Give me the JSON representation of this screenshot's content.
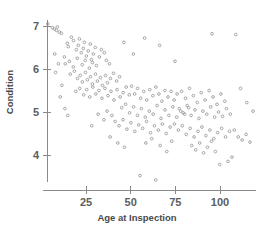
{
  "chart_data": {
    "type": "scatter",
    "title": "",
    "xlabel": "Age at Inspection",
    "ylabel": "Condition",
    "xlim": [
      0,
      120
    ],
    "ylim": [
      3.2,
      7.4
    ],
    "xticks": [
      25,
      50,
      75,
      100
    ],
    "xticklabels": [
      "25",
      "50",
      "75",
      "100"
    ],
    "yticks": [
      4,
      5,
      6,
      7
    ],
    "yticklabels": [
      "4",
      "5",
      "6",
      "7"
    ],
    "grid": false,
    "legend": null,
    "marker": "open-circle",
    "marker_color": "#9d9d9d",
    "axis_color": "#8a8a8a",
    "n_points": 201,
    "points": [
      [
        3.6,
        7.05
      ],
      [
        6.2,
        6.96
      ],
      [
        7.3,
        6.93
      ],
      [
        8.4,
        6.9
      ],
      [
        9.0,
        6.98
      ],
      [
        10.1,
        6.86
      ],
      [
        11.2,
        6.83
      ],
      [
        14.5,
        6.6
      ],
      [
        15.1,
        6.52
      ],
      [
        16.8,
        6.74
      ],
      [
        18.0,
        6.66
      ],
      [
        19.6,
        6.45
      ],
      [
        20.7,
        6.55
      ],
      [
        21.3,
        6.7
      ],
      [
        22.4,
        6.38
      ],
      [
        23.5,
        6.48
      ],
      [
        24.1,
        6.62
      ],
      [
        25.2,
        6.3
      ],
      [
        26.3,
        6.42
      ],
      [
        27.4,
        6.58
      ],
      [
        28.0,
        6.22
      ],
      [
        29.1,
        6.35
      ],
      [
        30.2,
        6.5
      ],
      [
        12.9,
        6.28
      ],
      [
        13.4,
        6.12
      ],
      [
        15.7,
        6.18
      ],
      [
        17.9,
        6.05
      ],
      [
        20.1,
        6.25
      ],
      [
        22.9,
        6.1
      ],
      [
        24.6,
        6.2
      ],
      [
        26.9,
        6.02
      ],
      [
        28.6,
        6.15
      ],
      [
        30.8,
        6.08
      ],
      [
        32.5,
        6.28
      ],
      [
        33.6,
        6.45
      ],
      [
        35.3,
        6.38
      ],
      [
        36.4,
        6.2
      ],
      [
        38.1,
        6.12
      ],
      [
        16.2,
        5.88
      ],
      [
        18.5,
        5.95
      ],
      [
        20.2,
        5.78
      ],
      [
        21.8,
        5.85
      ],
      [
        23.0,
        5.7
      ],
      [
        24.7,
        5.92
      ],
      [
        25.8,
        5.75
      ],
      [
        27.5,
        5.82
      ],
      [
        28.6,
        5.65
      ],
      [
        30.3,
        5.88
      ],
      [
        31.4,
        5.72
      ],
      [
        33.1,
        5.8
      ],
      [
        34.2,
        5.62
      ],
      [
        35.9,
        5.85
      ],
      [
        37.0,
        5.68
      ],
      [
        38.7,
        5.78
      ],
      [
        40.4,
        5.9
      ],
      [
        42.1,
        5.72
      ],
      [
        43.8,
        5.82
      ],
      [
        19.3,
        5.48
      ],
      [
        21.5,
        5.55
      ],
      [
        23.7,
        5.4
      ],
      [
        25.4,
        5.52
      ],
      [
        27.1,
        5.35
      ],
      [
        28.8,
        5.58
      ],
      [
        30.5,
        5.42
      ],
      [
        32.2,
        5.5
      ],
      [
        33.9,
        5.32
      ],
      [
        35.6,
        5.55
      ],
      [
        37.3,
        5.38
      ],
      [
        39.0,
        5.48
      ],
      [
        40.7,
        5.28
      ],
      [
        42.4,
        5.52
      ],
      [
        44.1,
        5.35
      ],
      [
        45.8,
        5.45
      ],
      [
        47.5,
        5.58
      ],
      [
        49.2,
        5.4
      ],
      [
        8.0,
        5.92
      ],
      [
        10.6,
        5.35
      ],
      [
        13.2,
        5.08
      ],
      [
        11.5,
        5.62
      ],
      [
        14.8,
        4.92
      ],
      [
        7.5,
        6.35
      ],
      [
        9.6,
        6.12
      ],
      [
        50.5,
        5.6
      ],
      [
        52.2,
        5.42
      ],
      [
        53.9,
        5.55
      ],
      [
        55.6,
        5.32
      ],
      [
        57.3,
        5.48
      ],
      [
        59.0,
        5.28
      ],
      [
        60.7,
        5.52
      ],
      [
        62.4,
        5.38
      ],
      [
        64.1,
        5.58
      ],
      [
        65.8,
        5.42
      ],
      [
        67.5,
        5.25
      ],
      [
        69.2,
        5.5
      ],
      [
        70.9,
        5.35
      ],
      [
        72.6,
        5.48
      ],
      [
        74.3,
        5.28
      ],
      [
        76.0,
        5.42
      ],
      [
        45.0,
        5.1
      ],
      [
        47.2,
        5.18
      ],
      [
        49.4,
        4.98
      ],
      [
        51.6,
        5.12
      ],
      [
        53.8,
        4.92
      ],
      [
        56.0,
        5.08
      ],
      [
        58.2,
        4.88
      ],
      [
        60.4,
        5.02
      ],
      [
        62.6,
        4.95
      ],
      [
        64.8,
        5.15
      ],
      [
        67.0,
        4.85
      ],
      [
        69.2,
        5.05
      ],
      [
        71.4,
        4.92
      ],
      [
        73.6,
        5.12
      ],
      [
        75.8,
        4.88
      ],
      [
        78.0,
        5.02
      ],
      [
        80.2,
        4.95
      ],
      [
        82.4,
        5.1
      ],
      [
        41.3,
        4.78
      ],
      [
        43.5,
        4.68
      ],
      [
        45.7,
        4.82
      ],
      [
        47.9,
        4.6
      ],
      [
        50.1,
        4.75
      ],
      [
        52.3,
        4.55
      ],
      [
        54.5,
        4.7
      ],
      [
        56.7,
        4.62
      ],
      [
        58.9,
        4.78
      ],
      [
        61.1,
        4.52
      ],
      [
        63.3,
        4.68
      ],
      [
        65.5,
        4.58
      ],
      [
        67.7,
        4.72
      ],
      [
        69.9,
        4.5
      ],
      [
        72.1,
        4.65
      ],
      [
        78.5,
        5.48
      ],
      [
        80.7,
        5.32
      ],
      [
        82.9,
        5.55
      ],
      [
        85.1,
        5.38
      ],
      [
        87.3,
        5.22
      ],
      [
        89.5,
        5.45
      ],
      [
        91.7,
        5.28
      ],
      [
        93.9,
        5.5
      ],
      [
        96.1,
        5.35
      ],
      [
        98.3,
        5.18
      ],
      [
        100.5,
        5.42
      ],
      [
        102.7,
        5.25
      ],
      [
        77.2,
        5.08
      ],
      [
        79.4,
        4.98
      ],
      [
        81.6,
        5.15
      ],
      [
        83.8,
        4.92
      ],
      [
        86.0,
        5.05
      ],
      [
        88.2,
        4.85
      ],
      [
        90.4,
        5.02
      ],
      [
        92.6,
        4.95
      ],
      [
        94.8,
        5.12
      ],
      [
        97.0,
        4.88
      ],
      [
        99.2,
        5.0
      ],
      [
        101.4,
        4.9
      ],
      [
        103.6,
        5.08
      ],
      [
        105.8,
        4.95
      ],
      [
        74.5,
        4.72
      ],
      [
        76.7,
        4.58
      ],
      [
        78.9,
        4.68
      ],
      [
        81.1,
        4.48
      ],
      [
        83.3,
        4.62
      ],
      [
        85.5,
        4.42
      ],
      [
        87.7,
        4.55
      ],
      [
        89.9,
        4.65
      ],
      [
        92.1,
        4.45
      ],
      [
        94.3,
        4.58
      ],
      [
        96.5,
        4.38
      ],
      [
        98.7,
        4.52
      ],
      [
        100.9,
        4.62
      ],
      [
        103.1,
        4.42
      ],
      [
        105.3,
        4.55
      ],
      [
        84.2,
        4.22
      ],
      [
        86.4,
        4.12
      ],
      [
        88.6,
        4.28
      ],
      [
        90.8,
        4.05
      ],
      [
        93.0,
        4.18
      ],
      [
        95.2,
        4.32
      ],
      [
        97.4,
        4.08
      ],
      [
        108.0,
        4.58
      ],
      [
        110.2,
        4.42
      ],
      [
        112.4,
        4.35
      ],
      [
        114.6,
        4.48
      ],
      [
        116.8,
        4.3
      ],
      [
        104.5,
        3.85
      ],
      [
        106.7,
        3.95
      ],
      [
        99.8,
        3.78
      ],
      [
        55.2,
        3.52
      ],
      [
        64.0,
        3.42
      ],
      [
        42.8,
        4.28
      ],
      [
        46.5,
        4.18
      ],
      [
        38.5,
        4.42
      ],
      [
        66.5,
        4.22
      ],
      [
        70.2,
        4.08
      ],
      [
        73.0,
        4.32
      ],
      [
        118.5,
        5.02
      ],
      [
        115.0,
        5.22
      ],
      [
        111.5,
        5.55
      ],
      [
        108.8,
        6.8
      ],
      [
        95.5,
        6.82
      ],
      [
        57.8,
        6.72
      ],
      [
        66.2,
        6.55
      ],
      [
        74.8,
        6.18
      ],
      [
        46.2,
        6.62
      ],
      [
        51.5,
        6.35
      ],
      [
        31.8,
        4.95
      ],
      [
        35.0,
        4.82
      ],
      [
        28.2,
        4.68
      ],
      [
        58.5,
        4.28
      ],
      [
        61.8,
        4.38
      ],
      [
        36.8,
        5.02
      ],
      [
        39.5,
        4.92
      ]
    ]
  }
}
